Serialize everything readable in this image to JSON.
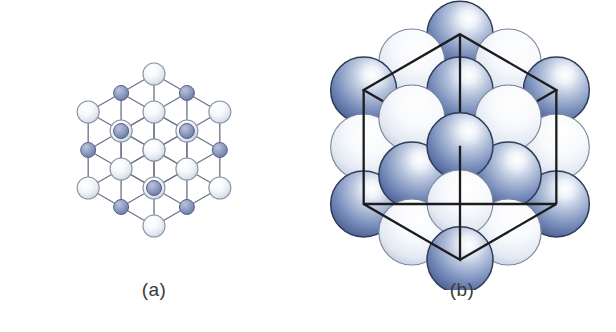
{
  "figure": {
    "kind": "crystal-structure-illustration",
    "background_color": "#ffffff",
    "panels": [
      {
        "id": "a",
        "caption": "(a)",
        "model": "ball-and-stick",
        "description": "Expanded ball-and-stick lattice showing alternating large pale ions and small blue-grey ions joined by straight bonds, drawn in isometric projection",
        "grid": {
          "nx": 3,
          "ny": 3,
          "nz": 3
        },
        "atoms": {
          "large": {
            "role": "anion",
            "count": 14,
            "radius_px": 11,
            "fill_center": "#ffffff",
            "fill_edge": "#d8e0ea",
            "stroke": "#8d93a3"
          },
          "small": {
            "role": "cation",
            "count": 13,
            "radius_px": 7.5,
            "fill_center": "#9aa6c4",
            "fill_edge": "#6c7ba3",
            "stroke": "#56618a"
          }
        },
        "bonds": {
          "stroke": "#6f7686",
          "width_px": 1.3
        }
      },
      {
        "id": "b",
        "caption": "(b)",
        "model": "space-filling",
        "description": "Close-packed space-filling model of the same lattice with the cubic unit cell drawn as a wire outline over the spheres",
        "spheres": {
          "blue": {
            "role": "anion",
            "fill_highlight": "#ffffff",
            "fill_mid": "#8ea2c8",
            "fill_edge": "#4f659b",
            "stroke": "#2f3b57"
          },
          "white": {
            "role": "cation",
            "fill_highlight": "#ffffff",
            "fill_mid": "#eef2f8",
            "fill_edge": "#c3cedf",
            "stroke": "#7c8699"
          }
        },
        "unit_cell": {
          "shape": "cube",
          "stroke": "#1c1c1c",
          "width_px": 2.4,
          "fill": "none"
        }
      }
    ]
  },
  "colors": {
    "anion_blue": "#5f77ab",
    "cation_white": "#e8edf5",
    "bond_gray": "#6f7686",
    "cube_black": "#1c1c1c",
    "caption_gray": "#3a3a3a",
    "page_white": "#ffffff"
  }
}
